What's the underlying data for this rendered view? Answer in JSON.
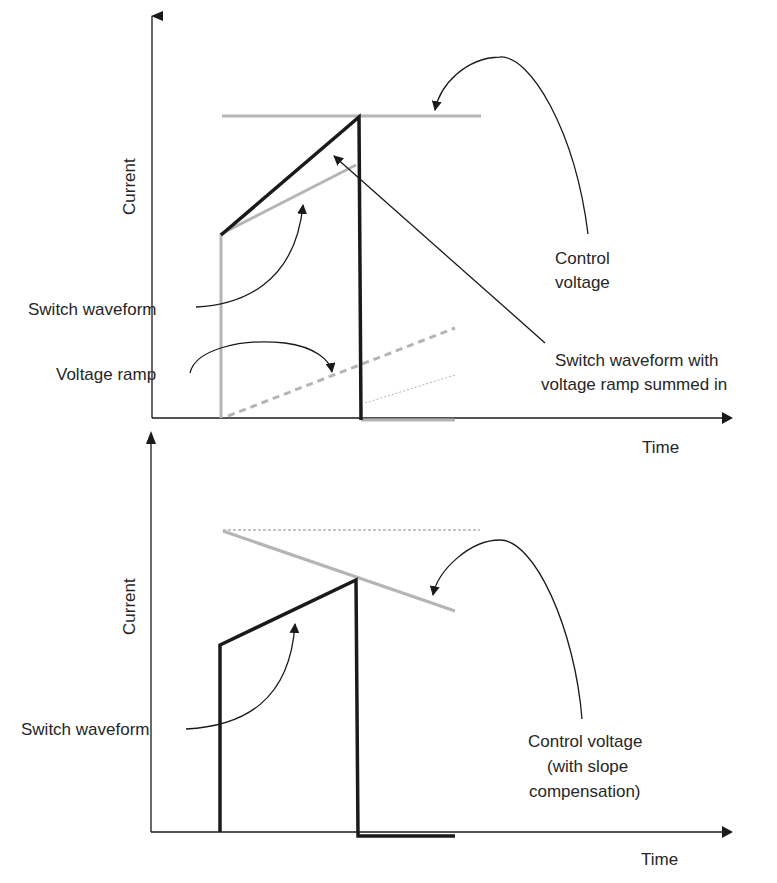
{
  "figure": {
    "top_panel": {
      "y_axis_label": "Current",
      "x_axis_label": "Time",
      "labels": {
        "switch_waveform": "Switch waveform",
        "voltage_ramp": "Voltage ramp",
        "control_voltage_line1": "Control",
        "control_voltage_line2": "voltage",
        "summed_line1": "Switch waveform with",
        "summed_line2": "voltage ramp summed in"
      }
    },
    "bottom_panel": {
      "y_axis_label": "Current",
      "x_axis_label": "Time",
      "labels": {
        "switch_waveform": "Switch waveform",
        "control_line1": "Control voltage",
        "control_line2": "(with slope",
        "control_line3": "compensation)"
      }
    },
    "colors": {
      "ink": "#1a1a1a",
      "gray_trace": "#b5b5b5",
      "text": "#262626"
    }
  }
}
